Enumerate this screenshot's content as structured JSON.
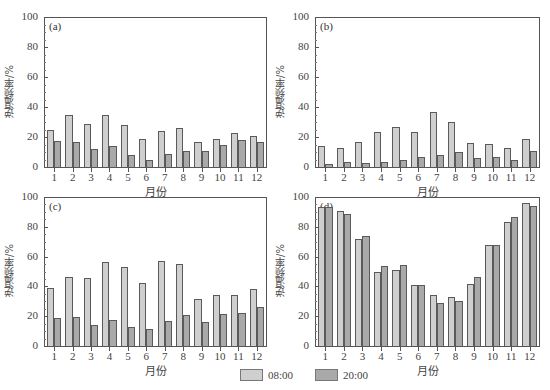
{
  "chart_data": [
    {
      "type": "bar",
      "panel_label": "(a)",
      "title": "",
      "xlabel": "月份",
      "ylabel": "逆温频率/%",
      "ylim": [
        0,
        100
      ],
      "yticks": [
        0,
        20,
        40,
        60,
        80,
        100
      ],
      "grid": false,
      "categories": [
        "1",
        "2",
        "3",
        "4",
        "5",
        "6",
        "7",
        "8",
        "9",
        "10",
        "11",
        "12"
      ],
      "series": [
        {
          "name": "08:00",
          "values": [
            25,
            35,
            29,
            34.5,
            28,
            19,
            24,
            26,
            17,
            19,
            23,
            20.5
          ]
        },
        {
          "name": "20:00",
          "values": [
            17.5,
            16.5,
            12,
            14,
            8,
            5,
            9,
            10.5,
            10.5,
            15,
            18,
            16.5
          ]
        }
      ]
    },
    {
      "type": "bar",
      "panel_label": "(b)",
      "title": "",
      "xlabel": "月份",
      "ylabel": "逆温频率/%",
      "ylim": [
        0,
        100
      ],
      "yticks": [
        0,
        20,
        40,
        60,
        80,
        100
      ],
      "grid": false,
      "categories": [
        "1",
        "2",
        "3",
        "4",
        "5",
        "6",
        "7",
        "8",
        "9",
        "10",
        "11",
        "12"
      ],
      "series": [
        {
          "name": "08:00",
          "values": [
            14,
            13,
            16.5,
            23.5,
            26.5,
            23.5,
            37,
            30,
            16,
            15.5,
            13,
            19
          ]
        },
        {
          "name": "20:00",
          "values": [
            2,
            3.5,
            2.5,
            3.5,
            5,
            6.5,
            8,
            10,
            6,
            7,
            5,
            10.5
          ]
        }
      ]
    },
    {
      "type": "bar",
      "panel_label": "(c)",
      "title": "",
      "xlabel": "月份",
      "ylabel": "逆温频率/%",
      "ylim": [
        0,
        100
      ],
      "yticks": [
        0,
        20,
        40,
        60,
        80,
        100
      ],
      "grid": false,
      "categories": [
        "1",
        "2",
        "3",
        "4",
        "5",
        "6",
        "7",
        "8",
        "9",
        "10",
        "11",
        "12"
      ],
      "series": [
        {
          "name": "08:00",
          "values": [
            39,
            46.5,
            45.5,
            56.5,
            53,
            42,
            57,
            55,
            31.5,
            34,
            34.5,
            38
          ]
        },
        {
          "name": "20:00",
          "values": [
            19,
            19.5,
            14,
            17.5,
            12.5,
            11.5,
            16.5,
            20.5,
            16,
            21.5,
            22,
            26
          ]
        }
      ]
    },
    {
      "type": "bar",
      "panel_label": "(d)",
      "title": "",
      "xlabel": "月份",
      "ylabel": "逆温频率/%",
      "ylim": [
        0,
        100
      ],
      "yticks": [
        0,
        20,
        40,
        60,
        80,
        100
      ],
      "grid": false,
      "categories": [
        "1",
        "2",
        "3",
        "4",
        "5",
        "6",
        "7",
        "8",
        "9",
        "10",
        "11",
        "12"
      ],
      "series": [
        {
          "name": "08:00",
          "values": [
            93,
            90.5,
            72,
            50,
            51,
            41,
            34,
            33,
            41.5,
            67.5,
            83.5,
            96
          ]
        },
        {
          "name": "20:00",
          "values": [
            93,
            88.5,
            74,
            53.5,
            54.5,
            41,
            29,
            30,
            46,
            68,
            86.5,
            94
          ]
        }
      ]
    }
  ],
  "legend": {
    "position": "bottom-center",
    "items": [
      {
        "label": "08:00",
        "color": "#cfcfcf"
      },
      {
        "label": "20:00",
        "color": "#a9a9a9"
      }
    ]
  },
  "colors": {
    "series_0": "#cfcfcf",
    "series_1": "#a9a9a9",
    "axis": "#555555"
  }
}
